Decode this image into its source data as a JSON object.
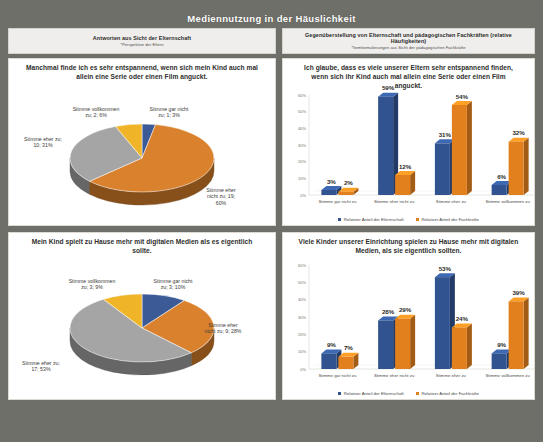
{
  "deck": {
    "title": "Mediennutzung in der Häuslichkeit",
    "background": "#6f6f69"
  },
  "columns": {
    "left": {
      "heading": "Antworten aus Sicht der Elternschaft",
      "subheading": "*Perspektive der Eltern"
    },
    "right": {
      "heading": "Gegenüberstellung von Elternschaft und pädagogischen Fachkräften (relative Häufigkeiten)",
      "subheading": "*Itemformulierungen aus Sicht der pädagogischen Fachkräfte"
    }
  },
  "colors": {
    "series_gar_nicht": "#3B5A96",
    "series_eher_nicht": "#D9812C",
    "series_eher_zu": "#A5A5A5",
    "series_vollkommen": "#F0B429",
    "elternschaft": "#31538F",
    "fachkraefte": "#E2801E",
    "panel_bg": "#ffffff",
    "header_bg": "#efeeec"
  },
  "legend_pie": [
    {
      "label": "Stimme gar nicht zu",
      "color": "#3B5A96"
    },
    {
      "label": "Stimme eher nicht zu",
      "color": "#D9812C"
    },
    {
      "label": "Stimme eher zu",
      "color": "#A5A5A5"
    },
    {
      "label": "Stimme vollkommen zu",
      "color": "#F0B429"
    }
  ],
  "legend_bar": [
    {
      "label": "Relativer Anteil der Elternschaft",
      "color": "#31538F"
    },
    {
      "label": "Relativer Anteil der Fachkräfte",
      "color": "#E2801E"
    }
  ],
  "chart_data": [
    {
      "id": "pie-eltern-entspannend",
      "type": "pie",
      "title": "Manchmal finde ich es sehr entspannend, wenn sich mein Kind auch mal allein eine Serie oder einen Film anguckt.",
      "categories": [
        "Stimme gar nicht zu",
        "Stimme eher nicht zu",
        "Stimme eher zu",
        "Stimme vollkommen zu"
      ],
      "counts": [
        1,
        19,
        10,
        2
      ],
      "values": [
        3,
        60,
        31,
        6
      ],
      "unit": "%",
      "labels": [
        "Stimme gar nicht\nzu; 1; 3%",
        "Stimme eher\nnicht zu; 19;\n60%",
        "Stimme eher zu;\n10; 31%",
        "Stimme vollkommen\nzu; 2; 6%"
      ],
      "colors": [
        "#3B5A96",
        "#D9812C",
        "#A5A5A5",
        "#F0B429"
      ],
      "legend_position": "bottom"
    },
    {
      "id": "bar-entspannend-vergleich",
      "type": "bar",
      "title": "Ich glaube, dass es viele unserer Eltern sehr entspannend finden, wenn sich ihr Kind auch mal allein eine Serie oder einen Film anguckt.",
      "categories": [
        "Stimme gar nicht zu",
        "Stimme eher nicht zu",
        "Stimme eher zu",
        "Stimme vollkommen zu"
      ],
      "series": [
        {
          "name": "Relativer Anteil der Elternschaft",
          "color": "#31538F",
          "values": [
            3,
            59,
            31,
            6
          ]
        },
        {
          "name": "Relativer Anteil der Fachkräfte",
          "color": "#E2801E",
          "values": [
            2,
            12,
            54,
            32
          ]
        }
      ],
      "ylim": [
        0,
        60
      ],
      "yticks": [
        "0%",
        "10%",
        "20%",
        "30%",
        "40%",
        "50%",
        "60%"
      ],
      "ylabel": "",
      "xlabel": "",
      "grid": false,
      "legend_position": "bottom"
    },
    {
      "id": "pie-eltern-digitale-medien",
      "type": "pie",
      "title": "Mein Kind spielt zu Hause mehr mit digitalen Medien als es eigentlich sollte.",
      "categories": [
        "Stimme gar nicht zu",
        "Stimme eher nicht zu",
        "Stimme eher zu",
        "Stimme vollkommen zu"
      ],
      "counts": [
        3,
        9,
        17,
        3
      ],
      "values": [
        10,
        28,
        53,
        9
      ],
      "unit": "%",
      "labels": [
        "Stimme gar nicht\nzu; 3; 10%",
        "Stimme eher\nnicht zu; 9; 28%",
        "Stimme eher zu;\n17; 53%",
        "Stimme vollkommen\nzu; 3; 9%"
      ],
      "colors": [
        "#3B5A96",
        "#D9812C",
        "#A5A5A5",
        "#F0B429"
      ],
      "legend_position": "bottom"
    },
    {
      "id": "bar-digitale-medien-vergleich",
      "type": "bar",
      "title": "Viele Kinder unserer Einrichtung spielen zu Hause mehr mit digitalen Medien, als sie eigentlich sollten.",
      "categories": [
        "Stimme gar nicht zu",
        "Stimme eher nicht zu",
        "Stimme eher zu",
        "Stimme vollkommen zu"
      ],
      "series": [
        {
          "name": "Relativer Anteil der Elternschaft",
          "color": "#31538F",
          "values": [
            9,
            28,
            53,
            9
          ]
        },
        {
          "name": "Relativer Anteil der Fachkräfte",
          "color": "#E2801E",
          "values": [
            7,
            29,
            24,
            39
          ]
        }
      ],
      "ylim": [
        0,
        60
      ],
      "yticks": [
        "0%",
        "10%",
        "20%",
        "30%",
        "40%",
        "50%",
        "60%"
      ],
      "ylabel": "",
      "xlabel": "",
      "grid": false,
      "legend_position": "bottom"
    }
  ]
}
